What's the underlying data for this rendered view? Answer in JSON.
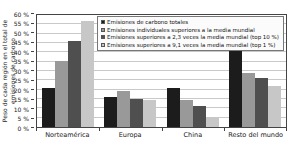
{
  "chart_data": {
    "type": "bar",
    "title": "",
    "ylabel": "Peso de cada región en el total de emisiones de carbono",
    "categories": [
      "Norteamérica",
      "Europa",
      "China",
      "Resto del mundo"
    ],
    "series": [
      {
        "name": "Emisiones de carbono totales",
        "color": "#1c1c1c",
        "values": [
          21,
          16,
          21,
          41
        ]
      },
      {
        "name": "Emisiones individuales superiores a la media mundial",
        "color": "#999999",
        "values": [
          35.5,
          19.5,
          14.5,
          29
        ]
      },
      {
        "name": "Emisiones superiores a 2,3 veces la media mundial (top 10 %)",
        "color": "#4f4f4f",
        "values": [
          46,
          15,
          11.5,
          26
        ]
      },
      {
        "name": "Emisiones superiores a 9,1 veces la media mundial (top 1 %)",
        "color": "#c7c7c7",
        "values": [
          57,
          14.5,
          5.5,
          22
        ]
      }
    ],
    "ylim": [
      0,
      60
    ],
    "ytick_step": 5,
    "ytick_suffix": " %",
    "grid": true,
    "gridline_color": "#c9c9c9",
    "legend_position": "top-right"
  }
}
